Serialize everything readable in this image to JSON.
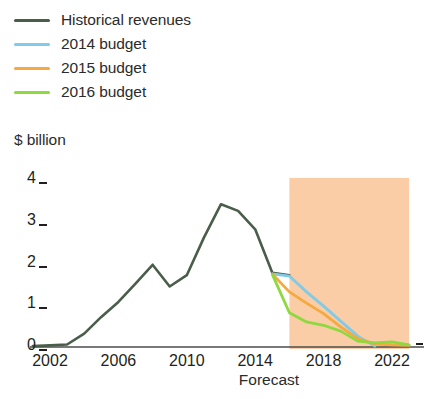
{
  "chart_data": {
    "type": "line",
    "title": "",
    "xlabel": "Forecast",
    "ylabel": "$ billion",
    "ylim": [
      0,
      4.2
    ],
    "xlim": [
      2001,
      2023.5
    ],
    "yticks": [
      "0",
      "1",
      "2",
      "3",
      "4"
    ],
    "ytick_values": [
      0,
      1,
      2,
      3,
      4
    ],
    "xticks": [
      "2002",
      "2006",
      "2010",
      "2014",
      "2018",
      "2022"
    ],
    "xtick_values": [
      2002,
      2006,
      2010,
      2014,
      2018,
      2022
    ],
    "grid": false,
    "legend_position": "top-left",
    "forecast_band": {
      "label": "Forecast",
      "x_start": 2016,
      "x_end": 2023,
      "y_top": 4.05,
      "color": "#FBCDA6"
    },
    "series": [
      {
        "name": "Historical revenues",
        "color": "#4A5D4A",
        "x": [
          2001,
          2002,
          2003,
          2004,
          2005,
          2006,
          2007,
          2008,
          2009,
          2010,
          2011,
          2012,
          2013,
          2014,
          2015,
          2016
        ],
        "values": [
          0.02,
          0.04,
          0.06,
          0.32,
          0.72,
          1.08,
          1.52,
          1.97,
          1.45,
          1.72,
          2.62,
          3.42,
          3.26,
          2.82,
          1.78,
          1.72
        ]
      },
      {
        "name": "2014 budget",
        "color": "#7FCBE8",
        "x": [
          2015,
          2016,
          2017,
          2018,
          2019,
          2020,
          2021
        ],
        "values": [
          1.75,
          1.7,
          1.32,
          0.98,
          0.62,
          0.26,
          0.02
        ]
      },
      {
        "name": "2015 budget",
        "color": "#F5A941",
        "x": [
          2015,
          2016,
          2017,
          2018,
          2019,
          2020,
          2021,
          2022,
          2023
        ],
        "values": [
          1.75,
          1.32,
          1.05,
          0.8,
          0.48,
          0.2,
          0.07,
          0.05,
          0.04
        ]
      },
      {
        "name": "2016 budget",
        "color": "#8DD93F",
        "x": [
          2015,
          2016,
          2017,
          2018,
          2019,
          2020,
          2021,
          2022,
          2023
        ],
        "values": [
          1.74,
          0.82,
          0.6,
          0.52,
          0.38,
          0.14,
          0.1,
          0.12,
          0.05
        ]
      }
    ]
  },
  "legend": {
    "items": [
      {
        "label": "Historical revenues",
        "color": "#4A5D4A"
      },
      {
        "label": "2014 budget",
        "color": "#7FCBE8"
      },
      {
        "label": "2015 budget",
        "color": "#F5A941"
      },
      {
        "label": "2016 budget",
        "color": "#8DD93F"
      }
    ]
  },
  "axes": {
    "y_title": "$ billion",
    "x_note": "Forecast",
    "y_ticks": [
      "4",
      "3",
      "2",
      "1",
      "0"
    ],
    "x_ticks": [
      "2002",
      "2006",
      "2010",
      "2014",
      "2018",
      "2022"
    ]
  }
}
